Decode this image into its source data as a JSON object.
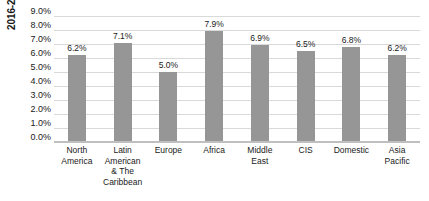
{
  "chart_data": {
    "type": "bar",
    "title": "",
    "subtitle": "",
    "xlabel": "",
    "ylabel": "2016-2034 O&D Traffic CAGR",
    "categories": [
      "North America",
      "Latin American & The Caribbean",
      "Europe",
      "Africa",
      "Middle East",
      "CIS",
      "Domestic",
      "Asia Pacific"
    ],
    "values": [
      6.2,
      7.1,
      5.0,
      7.9,
      6.9,
      6.5,
      6.8,
      6.2
    ],
    "value_labels": [
      "6.2%",
      "7.1%",
      "5.0%",
      "7.9%",
      "6.9%",
      "6.5%",
      "6.8%",
      "6.2%"
    ],
    "ylim": [
      0,
      9
    ],
    "ytick_values": [
      9.0,
      8.0,
      7.0,
      6.0,
      5.0,
      4.0,
      3.0,
      2.0,
      1.0,
      0.0
    ],
    "ytick_labels": [
      "9.0%",
      "8.0%",
      "7.0%",
      "6.0%",
      "5.0%",
      "4.0%",
      "3.0%",
      "2.0%",
      "1.0%",
      "0.0%"
    ],
    "grid": true,
    "legend": false,
    "legend_position": "none",
    "bar_color": "#969696",
    "gridline_color": "#d9d9d9",
    "axis_color": "#bfbfbf",
    "text_color": "#1a1a1a",
    "background": "#ffffff"
  }
}
